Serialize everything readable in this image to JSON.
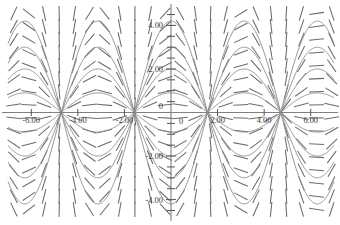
{
  "chart_data": {
    "type": "line",
    "title": "",
    "subtitle": "",
    "xlabel": "",
    "ylabel": "",
    "grid": false,
    "legend": "none",
    "plot_kind": "slope-field-with-solution-curves",
    "equation": "dy/dx = -y*tan(x)",
    "xlim": [
      -7.0,
      7.0
    ],
    "ylim": [
      -4.8,
      4.8
    ],
    "x_ticks": [
      -6.0,
      -4.0,
      -2.0,
      0.0,
      2.0,
      4.0,
      6.0
    ],
    "x_tick_labels": [
      "-6.00",
      "-4.00",
      "-2.00",
      "0",
      "2.00",
      "4.00",
      "6.00"
    ],
    "y_ticks": [
      -4.0,
      -2.0,
      0.0,
      2.0,
      4.0
    ],
    "y_tick_labels": [
      "-4.00",
      "-2.00",
      "0",
      "2.00",
      "4.00"
    ],
    "y_minor_ticks": [
      -4.5,
      -3.5,
      -3.0,
      -2.5,
      -1.5,
      -1.0,
      -0.5,
      0.5,
      1.0,
      1.5,
      2.5,
      3.0,
      3.5,
      4.5
    ],
    "zero_nodes_x": [
      -4.712,
      -1.571,
      1.571,
      4.712
    ],
    "colors": {
      "axis": "#808080",
      "tick": "#555555",
      "field_dash": "#6b6b6b",
      "solution_curve": "#8f8f8f",
      "background": "#ffffff",
      "label_text": "#3a3a3a"
    },
    "field": {
      "dash_half_length_px": 7.5,
      "x_samples": [
        -6.75,
        -6.1,
        -5.45,
        -4.8,
        -4.15,
        -3.5,
        -2.85,
        -2.2,
        -1.55,
        -0.9,
        -0.25,
        0.4,
        1.05,
        1.7,
        2.35,
        3.0,
        3.65,
        4.3,
        4.95,
        5.6,
        6.25,
        6.9
      ],
      "y_samples": [
        -4.45,
        -3.85,
        -3.25,
        -2.65,
        -2.05,
        -1.45,
        -0.85,
        -0.25,
        0.35,
        0.95,
        1.55,
        2.15,
        2.75,
        3.35,
        3.95,
        4.55
      ]
    },
    "series": [
      {
        "name": "curve-amp-0.9",
        "amplitude": 0.9
      },
      {
        "name": "curve-amp-2.0",
        "amplitude": 2.0
      },
      {
        "name": "curve-amp-3.0",
        "amplitude": 3.0
      },
      {
        "name": "curve-amp-4.2",
        "amplitude": 4.2
      },
      {
        "name": "curve-amp-neg-0.9",
        "amplitude": -0.9
      },
      {
        "name": "curve-amp-neg-2.0",
        "amplitude": -2.0
      },
      {
        "name": "curve-amp-neg-3.0",
        "amplitude": -3.0
      },
      {
        "name": "curve-amp-neg-4.2",
        "amplitude": -4.2
      }
    ]
  },
  "labels": {
    "x_neg6": "-6.00",
    "x_neg4": "-4.00",
    "x_neg2": "-2.00",
    "x_zero_right": "0",
    "x_pos2": "2.00",
    "x_pos4": "4.00",
    "x_pos6": "6.00",
    "y_pos4": "4.00",
    "y_pos2": "2.00",
    "y_zero": "0",
    "y_neg2": "-2.00",
    "y_neg4": "-4.00"
  }
}
